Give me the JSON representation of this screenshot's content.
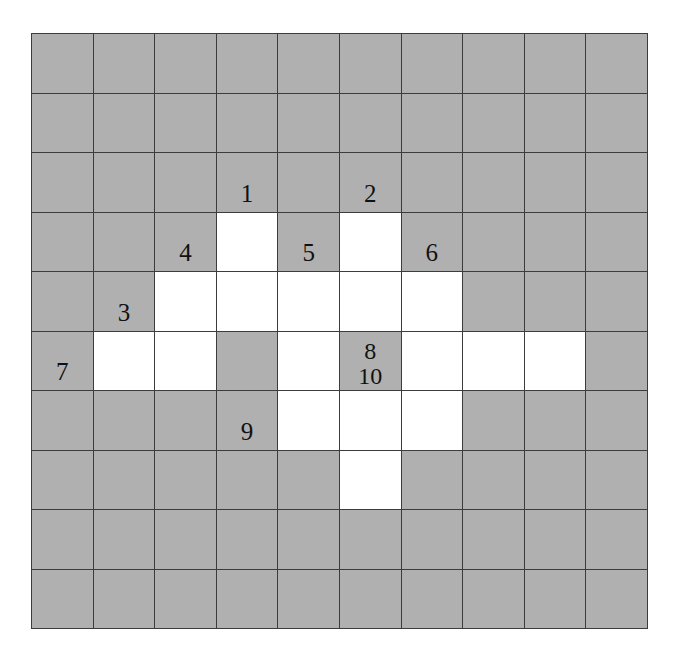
{
  "figure": {
    "name": "cell-grid-diagram",
    "rows": 10,
    "columns": 10,
    "colors": {
      "gray_cell": "#b0b0b0",
      "white_cell": "#ffffff",
      "grid_line": "#3c3c3c",
      "label_text": "#111111",
      "page_background": "#ffffff"
    }
  },
  "grid": {
    "cell_states": [
      [
        "gray",
        "gray",
        "gray",
        "gray",
        "gray",
        "gray",
        "gray",
        "gray",
        "gray",
        "gray"
      ],
      [
        "gray",
        "gray",
        "gray",
        "gray",
        "gray",
        "gray",
        "gray",
        "gray",
        "gray",
        "gray"
      ],
      [
        "gray",
        "gray",
        "gray",
        "gray",
        "gray",
        "gray",
        "gray",
        "gray",
        "gray",
        "gray"
      ],
      [
        "gray",
        "gray",
        "gray",
        "white",
        "gray",
        "white",
        "gray",
        "gray",
        "gray",
        "gray"
      ],
      [
        "gray",
        "gray",
        "white",
        "white",
        "white",
        "white",
        "white",
        "gray",
        "gray",
        "gray"
      ],
      [
        "gray",
        "white",
        "white",
        "gray",
        "white",
        "gray",
        "white",
        "white",
        "white",
        "gray"
      ],
      [
        "gray",
        "gray",
        "gray",
        "gray",
        "white",
        "white",
        "white",
        "gray",
        "gray",
        "gray"
      ],
      [
        "gray",
        "gray",
        "gray",
        "gray",
        "gray",
        "white",
        "gray",
        "gray",
        "gray",
        "gray"
      ],
      [
        "gray",
        "gray",
        "gray",
        "gray",
        "gray",
        "gray",
        "gray",
        "gray",
        "gray",
        "gray"
      ],
      [
        "gray",
        "gray",
        "gray",
        "gray",
        "gray",
        "gray",
        "gray",
        "gray",
        "gray",
        "gray"
      ]
    ],
    "cell_labels": [
      [
        "",
        "",
        "",
        "",
        "",
        "",
        "",
        "",
        "",
        ""
      ],
      [
        "",
        "",
        "",
        "",
        "",
        "",
        "",
        "",
        "",
        ""
      ],
      [
        "",
        "",
        "",
        "1",
        "",
        "2",
        "",
        "",
        "",
        ""
      ],
      [
        "",
        "",
        "4",
        "",
        "5",
        "",
        "6",
        "",
        "",
        ""
      ],
      [
        "",
        "3",
        "",
        "",
        "",
        "",
        "",
        "",
        "",
        ""
      ],
      [
        "7",
        "",
        "",
        "",
        "",
        "8\n10",
        "",
        "",
        "",
        ""
      ],
      [
        "",
        "",
        "",
        "9",
        "",
        "",
        "",
        "",
        "",
        ""
      ],
      [
        "",
        "",
        "",
        "",
        "",
        "",
        "",
        "",
        "",
        ""
      ],
      [
        "",
        "",
        "",
        "",
        "",
        "",
        "",
        "",
        "",
        ""
      ],
      [
        "",
        "",
        "",
        "",
        "",
        "",
        "",
        "",
        "",
        ""
      ]
    ],
    "labels_list": [
      {
        "id": "1",
        "row": 2,
        "col": 3
      },
      {
        "id": "2",
        "row": 2,
        "col": 5
      },
      {
        "id": "4",
        "row": 3,
        "col": 2
      },
      {
        "id": "5",
        "row": 3,
        "col": 4
      },
      {
        "id": "6",
        "row": 3,
        "col": 6
      },
      {
        "id": "3",
        "row": 4,
        "col": 1
      },
      {
        "id": "7",
        "row": 5,
        "col": 0
      },
      {
        "id": "8",
        "row": 5,
        "col": 5
      },
      {
        "id": "10",
        "row": 5,
        "col": 5
      },
      {
        "id": "9",
        "row": 6,
        "col": 3
      }
    ]
  }
}
